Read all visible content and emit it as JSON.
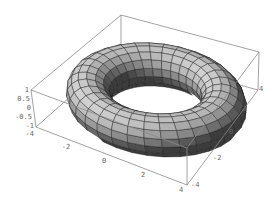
{
  "chart_data": {
    "type": "surface3d",
    "title": "",
    "surface": "torus",
    "parameters": {
      "major_radius": 3,
      "minor_radius": 1,
      "u_segments": 32,
      "v_segments": 16
    },
    "axes": {
      "x": {
        "label": "",
        "range": [
          -4,
          4
        ],
        "ticks": [
          "-2",
          "0",
          "2",
          "4"
        ]
      },
      "y": {
        "label": "",
        "range": [
          -4,
          4
        ],
        "ticks": [
          "-4",
          "-2",
          "0",
          "2",
          "4"
        ]
      },
      "z": {
        "label": "",
        "range": [
          -1,
          1
        ],
        "ticks": [
          "1",
          "0.5",
          "0",
          "-0.5",
          "-1"
        ]
      }
    },
    "bounding_box": true,
    "colors": {
      "box": "#8a8a8a",
      "surface_light": "#c8c8c8",
      "surface_dark": "#2a2a2a",
      "mesh": "#1a1a1a",
      "tick_text": "#666666"
    }
  },
  "labels": {
    "z_ticks": [
      "1",
      "0.5",
      "0",
      "-0.5",
      "-1"
    ],
    "x_ticks": [
      "-4",
      "-2",
      "0",
      "2",
      "4"
    ],
    "y_ticks": [
      "-4",
      "-2",
      "0",
      "2",
      "4"
    ]
  }
}
